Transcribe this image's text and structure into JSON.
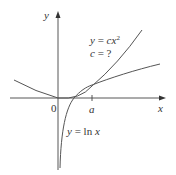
{
  "diagram": {
    "type": "function-graph",
    "axes": {
      "x_label": "x",
      "y_label": "y",
      "origin_label": "0",
      "tick_label": "a"
    },
    "curves": [
      {
        "name": "parabola",
        "equation": "y = cx²",
        "eq_lhs": "y = ",
        "eq_c": "c",
        "eq_x": "x",
        "eq_exp": "2"
      },
      {
        "name": "logarithm",
        "equation": "y = ln x",
        "eq_lhs": "y = ln ",
        "eq_x": "x"
      }
    ],
    "question": "c = ?",
    "question_lhs": "c",
    "question_rhs": " = ?",
    "colors": {
      "axis": "#444444",
      "curve": "#555555",
      "text": "#333333"
    }
  }
}
